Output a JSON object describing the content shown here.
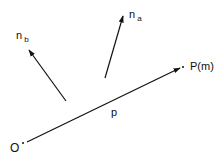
{
  "diagram": {
    "labels": {
      "origin": "O",
      "point": "P(m)",
      "vector_p": "p",
      "n_a_main": "n",
      "n_a_sub": "a",
      "n_b_main": "n",
      "n_b_sub": "b"
    },
    "colors": {
      "stroke": "#111111",
      "background": "#ffffff"
    },
    "vectors": [
      {
        "name": "p",
        "from": [
          27,
          142
        ],
        "to": [
          180,
          68
        ]
      },
      {
        "name": "n_a",
        "from": [
          105,
          78
        ],
        "to": [
          123,
          16
        ]
      },
      {
        "name": "n_b",
        "from": [
          66,
          101
        ],
        "to": [
          29,
          50
        ]
      }
    ]
  }
}
